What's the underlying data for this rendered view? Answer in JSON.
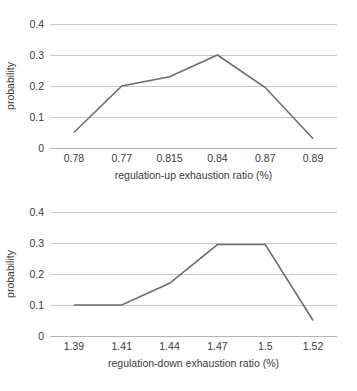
{
  "chart_data": [
    {
      "id": "regulation-up",
      "type": "line",
      "title": "",
      "xlabel": "regulation-up exhaustion ratio (%)",
      "ylabel": "probability",
      "categories": [
        "0.78",
        "0.77",
        "0.815",
        "0.84",
        "0.87",
        "0.89"
      ],
      "values": [
        0.05,
        0.2,
        0.23,
        0.3,
        0.195,
        0.03
      ],
      "yticks": [
        "0",
        "0.1",
        "0.2",
        "0.3",
        "0.4"
      ],
      "ytick_values": [
        0,
        0.1,
        0.2,
        0.3,
        0.4
      ],
      "ylim": [
        0,
        0.4
      ],
      "grid": "horizontal",
      "legend": "none",
      "series_color": "#6e6e6e",
      "grid_color": "#c9c9c9"
    },
    {
      "id": "regulation-down",
      "type": "line",
      "title": "",
      "xlabel": "regulation-down exhaustion ratio (%)",
      "ylabel": "probability",
      "categories": [
        "1.39",
        "1.41",
        "1.44",
        "1.47",
        "1.5",
        "1.52"
      ],
      "values": [
        0.1,
        0.1,
        0.17,
        0.295,
        0.295,
        0.05
      ],
      "yticks": [
        "0",
        "0.1",
        "0.2",
        "0.3",
        "0.4"
      ],
      "ytick_values": [
        0,
        0.1,
        0.2,
        0.3,
        0.4
      ],
      "ylim": [
        0,
        0.4
      ],
      "grid": "horizontal",
      "legend": "none",
      "series_color": "#6e6e6e",
      "grid_color": "#c9c9c9"
    }
  ]
}
